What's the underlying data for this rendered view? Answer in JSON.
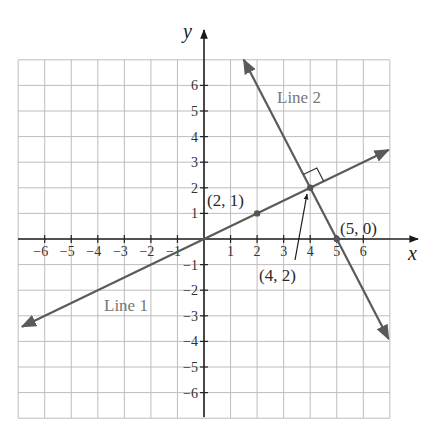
{
  "diagram": {
    "type": "coordinate-plane",
    "axes": {
      "x_label": "x",
      "y_label": "y",
      "x_ticks": [
        "-6",
        "-5",
        "-4",
        "-3",
        "-2",
        "-1",
        "1",
        "2",
        "3",
        "4",
        "5",
        "6"
      ],
      "y_ticks": [
        "6",
        "5",
        "4",
        "3",
        "2",
        "1",
        "-1",
        "-2",
        "-3",
        "-4",
        "-5",
        "-6"
      ],
      "range": {
        "x": [
          -7,
          7
        ],
        "y": [
          -7,
          7
        ]
      }
    },
    "lines": [
      {
        "name": "Line 1",
        "label": "Line 1",
        "slope": 0.5,
        "intercept": 0,
        "color": "#555555"
      },
      {
        "name": "Line 2",
        "label": "Line 2",
        "slope": -2,
        "intercept": 10,
        "color": "#555555"
      }
    ],
    "points": [
      {
        "label": "(2, 1)",
        "x": 2,
        "y": 1
      },
      {
        "label": "(4, 2)",
        "x": 4,
        "y": 2
      },
      {
        "label": "(5, 0)",
        "x": 5,
        "y": 0
      }
    ],
    "annotations": {
      "right_angle_at": "(4, 2)",
      "pointer_label": "(4, 2)"
    },
    "colors": {
      "grid": "#bdbdbd",
      "axis": "#222222",
      "line": "#5a5a5a",
      "label_gray": "#777777"
    }
  }
}
